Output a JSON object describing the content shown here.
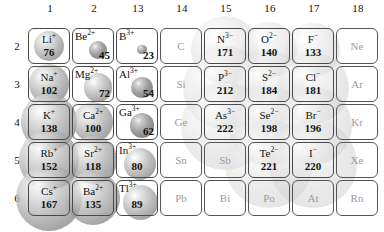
{
  "figure": {
    "kind": "periodic-table-ionic-radii",
    "group_headers": [
      "1",
      "2",
      "13",
      "14",
      "15",
      "16",
      "17",
      "18"
    ],
    "period_labels": [
      "2",
      "3",
      "4",
      "5",
      "6"
    ]
  },
  "chart_data": {
    "type": "table",
    "title": "",
    "xlabel": "",
    "ylabel": "",
    "columns": [
      "1",
      "2",
      "13",
      "14",
      "15",
      "16",
      "17",
      "18"
    ],
    "rows": [
      "2",
      "3",
      "4",
      "5",
      "6"
    ],
    "units": "pm",
    "cells": [
      {
        "symbol": "Li",
        "charge": "+",
        "value": "76",
        "group": "1",
        "period": "2",
        "active": true
      },
      {
        "symbol": "Be",
        "charge": "2+",
        "value": "45",
        "group": "2",
        "period": "2",
        "active": true
      },
      {
        "symbol": "B",
        "charge": "3+",
        "value": "23",
        "group": "13",
        "period": "2",
        "active": true
      },
      {
        "symbol": "C",
        "charge": "",
        "value": "",
        "group": "14",
        "period": "2",
        "active": false
      },
      {
        "symbol": "N",
        "charge": "3−",
        "value": "171",
        "group": "15",
        "period": "2",
        "active": true
      },
      {
        "symbol": "O",
        "charge": "2−",
        "value": "140",
        "group": "16",
        "period": "2",
        "active": true
      },
      {
        "symbol": "F",
        "charge": "−",
        "value": "133",
        "group": "17",
        "period": "2",
        "active": true
      },
      {
        "symbol": "Ne",
        "charge": "",
        "value": "",
        "group": "18",
        "period": "2",
        "active": false
      },
      {
        "symbol": "Na",
        "charge": "+",
        "value": "102",
        "group": "1",
        "period": "3",
        "active": true
      },
      {
        "symbol": "Mg",
        "charge": "2+",
        "value": "72",
        "group": "2",
        "period": "3",
        "active": true
      },
      {
        "symbol": "Al",
        "charge": "3+",
        "value": "54",
        "group": "13",
        "period": "3",
        "active": true
      },
      {
        "symbol": "Si",
        "charge": "",
        "value": "",
        "group": "14",
        "period": "3",
        "active": false
      },
      {
        "symbol": "P",
        "charge": "3−",
        "value": "212",
        "group": "15",
        "period": "3",
        "active": true
      },
      {
        "symbol": "S",
        "charge": "2−",
        "value": "184",
        "group": "16",
        "period": "3",
        "active": true
      },
      {
        "symbol": "Cl",
        "charge": "−",
        "value": "181",
        "group": "17",
        "period": "3",
        "active": true
      },
      {
        "symbol": "Ar",
        "charge": "",
        "value": "",
        "group": "18",
        "period": "3",
        "active": false
      },
      {
        "symbol": "K",
        "charge": "+",
        "value": "138",
        "group": "1",
        "period": "4",
        "active": true
      },
      {
        "symbol": "Ca",
        "charge": "2+",
        "value": "100",
        "group": "2",
        "period": "4",
        "active": true
      },
      {
        "symbol": "Ga",
        "charge": "3+",
        "value": "62",
        "group": "13",
        "period": "4",
        "active": true
      },
      {
        "symbol": "Ge",
        "charge": "",
        "value": "",
        "group": "14",
        "period": "4",
        "active": false
      },
      {
        "symbol": "As",
        "charge": "3−",
        "value": "222",
        "group": "15",
        "period": "4",
        "active": true
      },
      {
        "symbol": "Se",
        "charge": "2−",
        "value": "198",
        "group": "16",
        "period": "4",
        "active": true
      },
      {
        "symbol": "Br",
        "charge": "−",
        "value": "196",
        "group": "17",
        "period": "4",
        "active": true
      },
      {
        "symbol": "Kr",
        "charge": "",
        "value": "",
        "group": "18",
        "period": "4",
        "active": false
      },
      {
        "symbol": "Rb",
        "charge": "+",
        "value": "152",
        "group": "1",
        "period": "5",
        "active": true
      },
      {
        "symbol": "Sr",
        "charge": "2+",
        "value": "118",
        "group": "2",
        "period": "5",
        "active": true
      },
      {
        "symbol": "In",
        "charge": "3+",
        "value": "80",
        "group": "13",
        "period": "5",
        "active": true
      },
      {
        "symbol": "Sn",
        "charge": "",
        "value": "",
        "group": "14",
        "period": "5",
        "active": false
      },
      {
        "symbol": "Sb",
        "charge": "",
        "value": "",
        "group": "15",
        "period": "5",
        "active": false
      },
      {
        "symbol": "Te",
        "charge": "2−",
        "value": "221",
        "group": "16",
        "period": "5",
        "active": true
      },
      {
        "symbol": "I",
        "charge": "−",
        "value": "220",
        "group": "17",
        "period": "5",
        "active": true
      },
      {
        "symbol": "Xe",
        "charge": "",
        "value": "",
        "group": "18",
        "period": "5",
        "active": false
      },
      {
        "symbol": "Cs",
        "charge": "+",
        "value": "167",
        "group": "1",
        "period": "6",
        "active": true
      },
      {
        "symbol": "Ba",
        "charge": "2+",
        "value": "135",
        "group": "2",
        "period": "6",
        "active": true
      },
      {
        "symbol": "Tl",
        "charge": "3+",
        "value": "89",
        "group": "13",
        "period": "6",
        "active": true
      },
      {
        "symbol": "Pb",
        "charge": "",
        "value": "",
        "group": "14",
        "period": "6",
        "active": false
      },
      {
        "symbol": "Bi",
        "charge": "",
        "value": "",
        "group": "15",
        "period": "6",
        "active": false
      },
      {
        "symbol": "Po",
        "charge": "",
        "value": "",
        "group": "16",
        "period": "6",
        "active": false
      },
      {
        "symbol": "At",
        "charge": "",
        "value": "",
        "group": "17",
        "period": "6",
        "active": false
      },
      {
        "symbol": "Rn",
        "charge": "",
        "value": "",
        "group": "18",
        "period": "6",
        "active": false
      }
    ]
  },
  "colors": {
    "cell_border": "#4a4a4a",
    "text": "#111111",
    "inactive_text": "#9b9b9b",
    "sphere_grey": "#a8a8a8",
    "background": "#ffffff"
  }
}
